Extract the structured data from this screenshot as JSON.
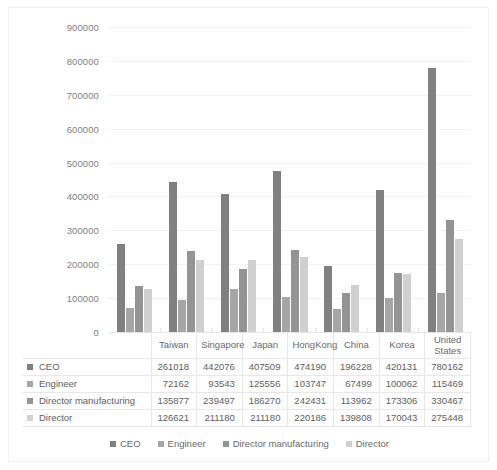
{
  "chart_data": {
    "type": "bar",
    "title": "",
    "xlabel": "",
    "ylabel": "",
    "ylim": [
      0,
      900000
    ],
    "ytick_step": 100000,
    "grid": true,
    "legend_position": "bottom",
    "categories": [
      "Taiwan",
      "Singapore",
      "Japan",
      "HongKong",
      "China",
      "Korea",
      "United States"
    ],
    "ytick_labels": [
      "900000",
      "800000",
      "700000",
      "600000",
      "500000",
      "400000",
      "300000",
      "200000",
      "100000",
      "0"
    ],
    "ytick_values": [
      900000,
      800000,
      700000,
      600000,
      500000,
      400000,
      300000,
      200000,
      100000,
      0
    ],
    "series": [
      {
        "name": "CEO",
        "color": "#808080",
        "values": [
          261018,
          442076,
          407509,
          474190,
          196228,
          420131,
          780162
        ]
      },
      {
        "name": "Engineer",
        "color": "#a6a6a6",
        "values": [
          72162,
          93543,
          125556,
          103747,
          67499,
          100062,
          115469
        ]
      },
      {
        "name": "Director manufacturing",
        "color": "#949494",
        "values": [
          135877,
          239497,
          186270,
          242431,
          113962,
          173306,
          330467
        ]
      },
      {
        "name": "Director",
        "color": "#d0d0d0",
        "values": [
          126621,
          211180,
          211180,
          220186,
          139808,
          170043,
          275448
        ]
      }
    ]
  },
  "table": {
    "corner_label": "",
    "headers": [
      "Taiwan",
      "Singapore",
      "Japan",
      "HongKong",
      "China",
      "Korea",
      "United States"
    ],
    "rows": [
      {
        "label": "CEO",
        "color": "#808080",
        "values": [
          "261018",
          "442076",
          "407509",
          "474190",
          "196228",
          "420131",
          "780162"
        ]
      },
      {
        "label": "Engineer",
        "color": "#a6a6a6",
        "values": [
          "72162",
          "93543",
          "125556",
          "103747",
          "67499",
          "100062",
          "115469"
        ]
      },
      {
        "label": "Director manufacturing",
        "color": "#949494",
        "values": [
          "135877",
          "239497",
          "186270",
          "242431",
          "113962",
          "173306",
          "330467"
        ]
      },
      {
        "label": "Director",
        "color": "#d0d0d0",
        "values": [
          "126621",
          "211180",
          "211180",
          "220186",
          "139808",
          "170043",
          "275448"
        ]
      }
    ]
  },
  "legend": {
    "items": [
      {
        "label": "CEO",
        "color": "#808080"
      },
      {
        "label": "Engineer",
        "color": "#a6a6a6"
      },
      {
        "label": "Director manufacturing",
        "color": "#949494"
      },
      {
        "label": "Director",
        "color": "#d0d0d0"
      }
    ]
  }
}
